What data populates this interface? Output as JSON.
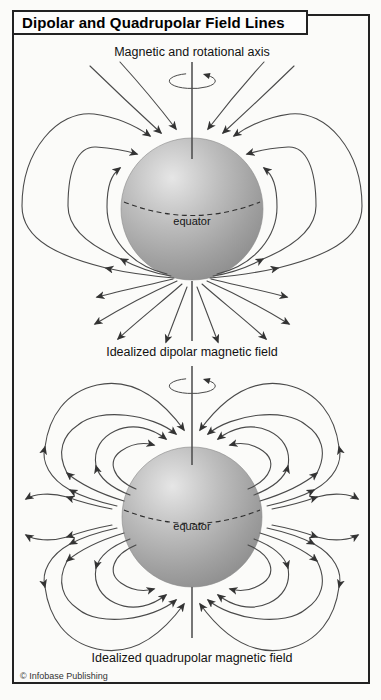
{
  "title": "Dipolar and Quadrupolar Field Lines",
  "dipole": {
    "axis_label": "Magnetic and rotational axis",
    "equator_label": "equator",
    "caption": "Idealized dipolar magnetic field"
  },
  "quadrupole": {
    "equator_label": "equator",
    "caption": "Idealized quadrupolar magnetic field"
  },
  "copyright": "© Infobase Publishing",
  "colors": {
    "field_line": "#4a4a4a",
    "arrow": "#333333",
    "sphere_highlight": "#e6e6e6",
    "sphere_shadow": "#8c8c8c",
    "frame_border": "#222222",
    "text": "#111111",
    "background": "#fbfbf9"
  }
}
